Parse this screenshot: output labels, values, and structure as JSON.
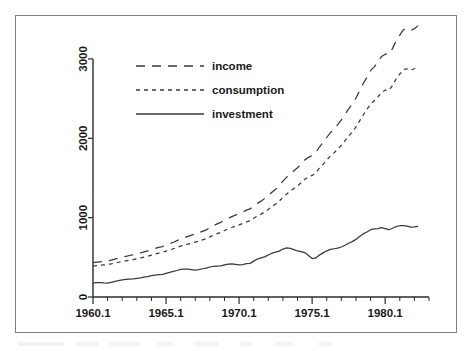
{
  "figure": {
    "background_color": "#ffffff",
    "frame_color": "#7b7f86",
    "line_color": "#3a3a3a",
    "text_color": "#1a1a1a"
  },
  "chart_data": {
    "type": "line",
    "title": "",
    "subtitle": "",
    "xlabel": "",
    "ylabel": "",
    "xlim": [
      1960.0,
      1983.0
    ],
    "ylim": [
      0,
      3100
    ],
    "grid": false,
    "legend_position": "top-left",
    "x_tick_labels": [
      "1960.1",
      "1965.1",
      "1970.1",
      "1975.1",
      "1980.1"
    ],
    "x_tick_values": [
      1960.0,
      1965.0,
      1970.0,
      1975.0,
      1980.0
    ],
    "x_minor_tick_interval": 1,
    "y_tick_labels": [
      "0",
      "1000",
      "2000",
      "3000"
    ],
    "y_tick_values": [
      0,
      1000,
      2000,
      3000
    ],
    "x_units": "year.quarter",
    "x": [
      1960.0,
      1960.25,
      1960.5,
      1960.75,
      1961.0,
      1961.25,
      1961.5,
      1961.75,
      1962.0,
      1962.25,
      1962.5,
      1962.75,
      1963.0,
      1963.25,
      1963.5,
      1963.75,
      1964.0,
      1964.25,
      1964.5,
      1964.75,
      1965.0,
      1965.25,
      1965.5,
      1965.75,
      1966.0,
      1966.25,
      1966.5,
      1966.75,
      1967.0,
      1967.25,
      1967.5,
      1967.75,
      1968.0,
      1968.25,
      1968.5,
      1968.75,
      1969.0,
      1969.25,
      1969.5,
      1969.75,
      1970.0,
      1970.25,
      1970.5,
      1970.75,
      1971.0,
      1971.25,
      1971.5,
      1971.75,
      1972.0,
      1972.25,
      1972.5,
      1972.75,
      1973.0,
      1973.25,
      1973.5,
      1973.75,
      1974.0,
      1974.25,
      1974.5,
      1974.75,
      1975.0,
      1975.25,
      1975.5,
      1975.75,
      1976.0,
      1976.25,
      1976.5,
      1976.75,
      1977.0,
      1977.25,
      1977.5,
      1977.75,
      1978.0,
      1978.25,
      1978.5,
      1978.75,
      1979.0,
      1979.25,
      1979.5,
      1979.75,
      1980.0,
      1980.25,
      1980.5,
      1980.75,
      1981.0,
      1981.25,
      1981.5,
      1981.75,
      1982.0,
      1982.25
    ],
    "series": [
      {
        "name": "income",
        "line_style": "long-dash",
        "values": [
          432,
          438,
          444,
          448,
          455,
          466,
          478,
          490,
          502,
          513,
          523,
          532,
          545,
          556,
          568,
          581,
          598,
          612,
          626,
          636,
          655,
          672,
          690,
          710,
          732,
          748,
          764,
          779,
          795,
          812,
          828,
          845,
          874,
          900,
          921,
          941,
          968,
          992,
          1013,
          1031,
          1050,
          1070,
          1095,
          1110,
          1148,
          1180,
          1208,
          1240,
          1278,
          1320,
          1358,
          1400,
          1460,
          1508,
          1548,
          1590,
          1628,
          1676,
          1728,
          1760,
          1782,
          1820,
          1890,
          1948,
          2010,
          2070,
          2118,
          2172,
          2232,
          2300,
          2370,
          2432,
          2508,
          2600,
          2690,
          2768,
          2852,
          2900,
          2960,
          3030,
          3060,
          3060,
          3130,
          3230,
          3300,
          3370,
          3380,
          3360,
          3380,
          3420
        ]
      },
      {
        "name": "consumption",
        "line_style": "short-dash",
        "values": [
          390,
          396,
          401,
          405,
          410,
          418,
          428,
          438,
          448,
          456,
          464,
          472,
          483,
          492,
          502,
          513,
          528,
          540,
          552,
          562,
          578,
          592,
          608,
          624,
          642,
          654,
          666,
          678,
          692,
          706,
          720,
          734,
          758,
          780,
          798,
          815,
          838,
          858,
          876,
          892,
          908,
          926,
          946,
          960,
          992,
          1020,
          1044,
          1072,
          1104,
          1140,
          1172,
          1208,
          1258,
          1298,
          1332,
          1368,
          1400,
          1440,
          1484,
          1512,
          1532,
          1566,
          1624,
          1672,
          1724,
          1776,
          1816,
          1862,
          1912,
          1970,
          2028,
          2080,
          2144,
          2220,
          2296,
          2362,
          2432,
          2472,
          2522,
          2580,
          2606,
          2606,
          2664,
          2748,
          2808,
          2866,
          2876,
          2860,
          2876,
          2910
        ]
      },
      {
        "name": "investment",
        "line_style": "solid",
        "values": [
          178,
          180,
          182,
          178,
          176,
          184,
          196,
          206,
          216,
          222,
          226,
          228,
          236,
          242,
          250,
          258,
          268,
          276,
          282,
          286,
          298,
          310,
          322,
          334,
          348,
          352,
          350,
          346,
          340,
          346,
          356,
          364,
          378,
          386,
          390,
          392,
          404,
          414,
          418,
          412,
          404,
          408,
          420,
          424,
          452,
          478,
          492,
          506,
          530,
          552,
          566,
          578,
          604,
          618,
          612,
          598,
          580,
          572,
          560,
          524,
          484,
          492,
          528,
          556,
          582,
          600,
          608,
          616,
          630,
          652,
          678,
          698,
          726,
          762,
          796,
          820,
          848,
          858,
          862,
          874,
          862,
          848,
          866,
          888,
          898,
          900,
          892,
          880,
          884,
          890
        ]
      }
    ]
  },
  "legend": {
    "entries": [
      {
        "label": "income",
        "style": "long-dash"
      },
      {
        "label": "consumption",
        "style": "short-dash"
      },
      {
        "label": "investment",
        "style": "solid"
      }
    ]
  }
}
